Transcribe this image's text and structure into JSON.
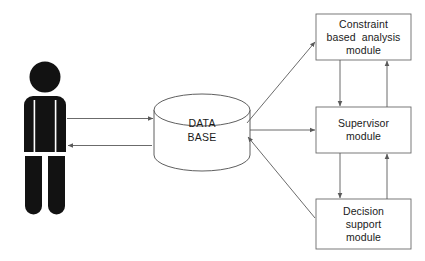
{
  "diagram": {
    "actor": {
      "name": "user-figure",
      "icon": "person-silhouette-icon",
      "fill": "#121212"
    },
    "datastore": {
      "icon": "database-cylinder-icon",
      "lines": [
        "DATA",
        "BASE"
      ],
      "stroke": "#4d4d4d",
      "fill": "#ffffff"
    },
    "modules": [
      {
        "id": "constraint-based-analysis-module",
        "lines": [
          "Constraint",
          "based  analysis",
          "module"
        ]
      },
      {
        "id": "supervisor-module",
        "lines": [
          "Supervisor",
          "module"
        ]
      },
      {
        "id": "decision-support-module",
        "lines": [
          "Decision",
          "support",
          "module"
        ]
      }
    ],
    "connectors": [
      {
        "id": "user-to-database",
        "from": "user-figure",
        "to": "database-cylinder",
        "direction": "right"
      },
      {
        "id": "database-to-user",
        "from": "database-cylinder",
        "to": "user-figure",
        "direction": "left"
      },
      {
        "id": "database-to-constraint-module",
        "from": "database-cylinder",
        "to": "constraint-based-analysis-module",
        "direction": "up-right"
      },
      {
        "id": "database-to-supervisor-module",
        "from": "database-cylinder",
        "to": "supervisor-module",
        "direction": "right"
      },
      {
        "id": "decision-module-to-database",
        "from": "decision-support-module",
        "to": "database-cylinder",
        "direction": "up-left"
      },
      {
        "id": "constraint-module-to-supervisor-module",
        "from": "constraint-based-analysis-module",
        "to": "supervisor-module",
        "direction": "down"
      },
      {
        "id": "supervisor-module-to-constraint-module",
        "from": "supervisor-module",
        "to": "constraint-based-analysis-module",
        "direction": "up"
      },
      {
        "id": "supervisor-module-to-decision-module",
        "from": "supervisor-module",
        "to": "decision-support-module",
        "direction": "down"
      },
      {
        "id": "decision-module-to-supervisor-module",
        "from": "decision-support-module",
        "to": "supervisor-module",
        "direction": "up"
      }
    ],
    "colors": {
      "line": "#5a5a5a",
      "box_border": "#6b6b6b",
      "text": "#1a1a1a",
      "actor_fill": "#121212",
      "background": "#ffffff"
    }
  }
}
